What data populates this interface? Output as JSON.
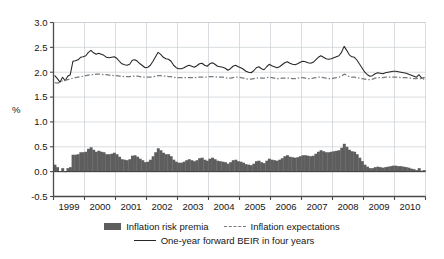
{
  "axis": {
    "y_title": "%",
    "y_ticks": [
      "3.0",
      "2.5",
      "2.0",
      "1.5",
      "1.0",
      "0.5",
      "0.0",
      "-0.5"
    ],
    "x_ticks": [
      "1999",
      "2000",
      "2001",
      "2002",
      "2003",
      "2004",
      "2005",
      "2006",
      "2007",
      "2008",
      "2009",
      "2010"
    ]
  },
  "legend": {
    "item1": "Inflation risk premia",
    "item2": "Inflation expectations",
    "item3": "One-year forward BEIR in four years"
  },
  "colors": {
    "premia_bar": "#5e5e5e",
    "expectations_line": "#7a7a7a",
    "beir_line": "#262626",
    "grid": "#c9cdd2",
    "axis": "#4a4a4a",
    "background": "#ffffff"
  },
  "chart_data": {
    "type": "line",
    "title": "",
    "subtitle": "",
    "xlabel": "",
    "ylabel": "%",
    "ylim": [
      -0.5,
      3.0
    ],
    "ytick_step": 0.5,
    "xlim": [
      "1999",
      "2011"
    ],
    "grid": true,
    "legend_position": "bottom",
    "x_tick_labels": [
      "1999",
      "2000",
      "2001",
      "2002",
      "2003",
      "2004",
      "2005",
      "2006",
      "2007",
      "2008",
      "2009",
      "2010"
    ],
    "x_start_year": 1999.0,
    "x_end_year": 2011.0,
    "sample_interval_years": 0.0833,
    "series": [
      {
        "name": "One-year forward BEIR in four years",
        "type": "line",
        "style": "solid",
        "color": "#262626",
        "values": [
          1.93,
          1.87,
          1.8,
          1.9,
          1.83,
          1.92,
          1.95,
          2.22,
          2.23,
          2.25,
          2.3,
          2.31,
          2.33,
          2.4,
          2.44,
          2.39,
          2.36,
          2.38,
          2.36,
          2.34,
          2.3,
          2.29,
          2.3,
          2.31,
          2.28,
          2.22,
          2.17,
          2.15,
          2.14,
          2.16,
          2.24,
          2.25,
          2.22,
          2.17,
          2.13,
          2.09,
          2.1,
          2.14,
          2.22,
          2.31,
          2.4,
          2.36,
          2.3,
          2.27,
          2.26,
          2.22,
          2.14,
          2.09,
          2.07,
          2.07,
          2.09,
          2.12,
          2.14,
          2.12,
          2.1,
          2.13,
          2.17,
          2.18,
          2.14,
          2.12,
          2.17,
          2.19,
          2.16,
          2.12,
          2.11,
          2.1,
          2.08,
          2.04,
          2.07,
          2.12,
          2.14,
          2.11,
          2.09,
          2.06,
          2.02,
          2.0,
          1.99,
          2.03,
          2.09,
          2.11,
          2.07,
          2.05,
          2.11,
          2.16,
          2.13,
          2.11,
          2.09,
          2.11,
          2.15,
          2.19,
          2.21,
          2.18,
          2.16,
          2.15,
          2.17,
          2.2,
          2.22,
          2.21,
          2.19,
          2.18,
          2.2,
          2.25,
          2.3,
          2.33,
          2.3,
          2.27,
          2.26,
          2.27,
          2.29,
          2.31,
          2.33,
          2.4,
          2.52,
          2.44,
          2.35,
          2.31,
          2.3,
          2.24,
          2.16,
          2.08,
          2.0,
          1.95,
          1.92,
          1.93,
          1.97,
          1.99,
          1.98,
          1.97,
          1.99,
          2.0,
          2.01,
          2.02,
          2.02,
          2.01,
          2.0,
          1.99,
          1.98,
          1.96,
          1.94,
          1.92,
          1.9,
          1.95,
          1.88,
          1.89
        ]
      },
      {
        "name": "Inflation expectations",
        "type": "line",
        "style": "dash-dot",
        "color": "#7a7a7a",
        "values": [
          1.79,
          1.78,
          1.8,
          1.83,
          1.84,
          1.85,
          1.86,
          1.88,
          1.89,
          1.9,
          1.91,
          1.92,
          1.93,
          1.94,
          1.95,
          1.95,
          1.96,
          1.96,
          1.96,
          1.95,
          1.95,
          1.94,
          1.94,
          1.93,
          1.93,
          1.92,
          1.92,
          1.91,
          1.91,
          1.91,
          1.92,
          1.92,
          1.92,
          1.91,
          1.9,
          1.9,
          1.9,
          1.9,
          1.91,
          1.92,
          1.93,
          1.93,
          1.92,
          1.92,
          1.91,
          1.91,
          1.9,
          1.89,
          1.89,
          1.89,
          1.89,
          1.89,
          1.89,
          1.89,
          1.89,
          1.9,
          1.9,
          1.9,
          1.9,
          1.9,
          1.91,
          1.91,
          1.91,
          1.9,
          1.9,
          1.9,
          1.89,
          1.88,
          1.88,
          1.89,
          1.9,
          1.9,
          1.89,
          1.88,
          1.87,
          1.86,
          1.86,
          1.87,
          1.88,
          1.89,
          1.88,
          1.88,
          1.89,
          1.9,
          1.89,
          1.88,
          1.87,
          1.87,
          1.88,
          1.88,
          1.88,
          1.88,
          1.87,
          1.87,
          1.88,
          1.89,
          1.89,
          1.88,
          1.87,
          1.87,
          1.88,
          1.89,
          1.9,
          1.9,
          1.89,
          1.88,
          1.87,
          1.87,
          1.88,
          1.89,
          1.9,
          1.92,
          1.96,
          1.94,
          1.91,
          1.9,
          1.9,
          1.89,
          1.88,
          1.87,
          1.86,
          1.85,
          1.85,
          1.86,
          1.88,
          1.89,
          1.89,
          1.89,
          1.9,
          1.9,
          1.9,
          1.9,
          1.9,
          1.9,
          1.89,
          1.89,
          1.89,
          1.88,
          1.88,
          1.87,
          1.87,
          1.88,
          1.86,
          1.86
        ]
      },
      {
        "name": "Inflation risk premia",
        "type": "bar",
        "color": "#5e5e5e",
        "values": [
          0.14,
          0.09,
          0.0,
          0.07,
          -0.01,
          0.07,
          0.09,
          0.34,
          0.34,
          0.35,
          0.39,
          0.39,
          0.4,
          0.46,
          0.49,
          0.44,
          0.4,
          0.42,
          0.4,
          0.39,
          0.35,
          0.35,
          0.36,
          0.38,
          0.35,
          0.3,
          0.25,
          0.24,
          0.23,
          0.25,
          0.32,
          0.33,
          0.3,
          0.26,
          0.23,
          0.19,
          0.2,
          0.24,
          0.31,
          0.39,
          0.47,
          0.43,
          0.38,
          0.35,
          0.35,
          0.31,
          0.24,
          0.2,
          0.18,
          0.18,
          0.2,
          0.23,
          0.25,
          0.23,
          0.21,
          0.23,
          0.27,
          0.28,
          0.24,
          0.22,
          0.26,
          0.28,
          0.25,
          0.22,
          0.21,
          0.2,
          0.19,
          0.16,
          0.19,
          0.23,
          0.24,
          0.21,
          0.2,
          0.18,
          0.15,
          0.14,
          0.13,
          0.16,
          0.21,
          0.22,
          0.19,
          0.17,
          0.22,
          0.26,
          0.24,
          0.23,
          0.22,
          0.24,
          0.27,
          0.31,
          0.33,
          0.3,
          0.29,
          0.28,
          0.29,
          0.31,
          0.33,
          0.33,
          0.32,
          0.31,
          0.32,
          0.36,
          0.4,
          0.43,
          0.41,
          0.39,
          0.39,
          0.4,
          0.41,
          0.42,
          0.43,
          0.48,
          0.56,
          0.5,
          0.44,
          0.41,
          0.4,
          0.35,
          0.28,
          0.21,
          0.14,
          0.1,
          0.07,
          0.07,
          0.09,
          0.1,
          0.09,
          0.08,
          0.09,
          0.1,
          0.11,
          0.12,
          0.12,
          0.11,
          0.11,
          0.1,
          0.09,
          0.08,
          0.06,
          0.05,
          0.03,
          0.07,
          0.02,
          0.03
        ]
      }
    ]
  }
}
